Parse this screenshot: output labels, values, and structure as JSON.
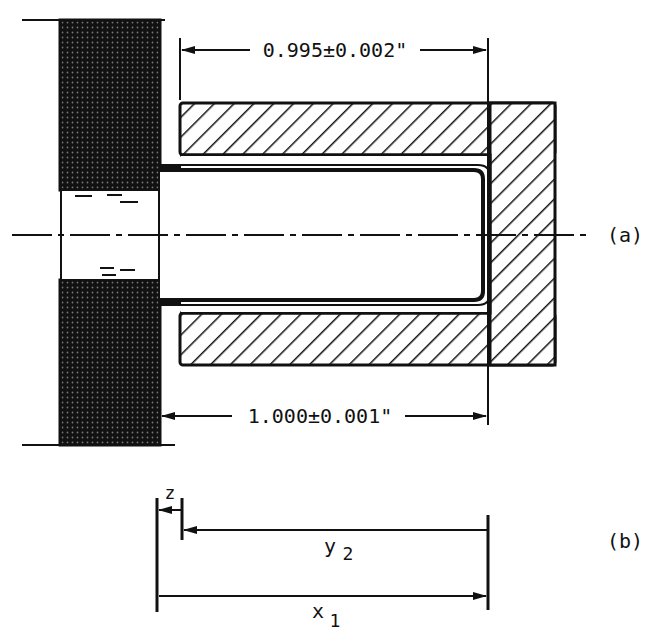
{
  "figure": {
    "part_a": {
      "label": "(a)",
      "dimension_top": "0.995±0.002\"",
      "dimension_bottom": "1.000±0.001\""
    },
    "part_b": {
      "label": "(b)",
      "z_label": "z",
      "y_label": "y",
      "y_subscript": "2",
      "x_label": "x",
      "x_subscript": "1"
    }
  },
  "colors": {
    "ink": "#111111",
    "background": "#ffffff"
  }
}
